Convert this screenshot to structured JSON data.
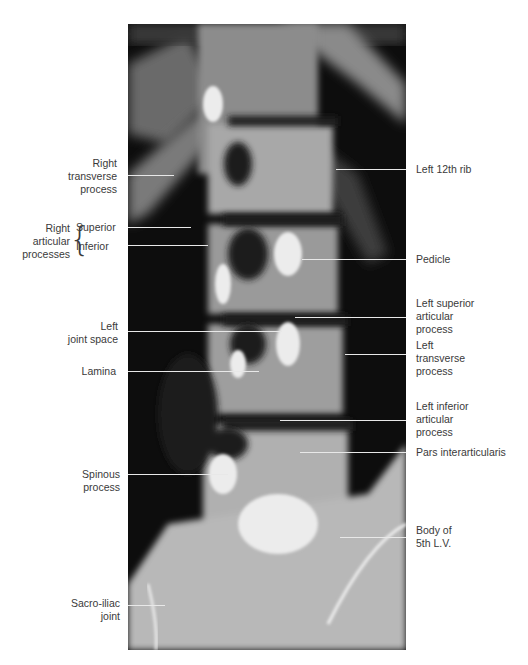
{
  "figure": {
    "labels_left": [
      {
        "id": "right-transverse-process",
        "text": "Right\ntransverse\nprocess"
      },
      {
        "id": "right-articular-processes",
        "text": "Right\narticular\nprocesses"
      },
      {
        "id": "left-joint-space",
        "text": "Left\njoint space"
      },
      {
        "id": "lamina",
        "text": "Lamina"
      },
      {
        "id": "spinous-process",
        "text": "Spinous\nprocess"
      },
      {
        "id": "sacro-iliac-joint",
        "text": "Sacro-iliac\njoint"
      }
    ],
    "articular_sub": {
      "superior": "Superior",
      "inferior": "Inferior"
    },
    "labels_right": [
      {
        "id": "left-12th-rib",
        "text": "Left 12th rib"
      },
      {
        "id": "pedicle",
        "text": "Pedicle"
      },
      {
        "id": "left-superior-articular-process",
        "text": "Left superior\narticular\nprocess"
      },
      {
        "id": "left-transverse-process",
        "text": "Left\ntransverse\nprocess"
      },
      {
        "id": "left-inferior-articular-process",
        "text": "Left inferior\narticular\nprocess"
      },
      {
        "id": "pars-interarticularis",
        "text": "Pars interarticularis"
      },
      {
        "id": "body-of-5th-lv",
        "text": "Body of\n5th L.V."
      }
    ]
  },
  "colors": {
    "background": "#ffffff",
    "xray_dark": "#0c0c0c",
    "bone_light": "#e6e6e6",
    "text": "#3a3a3a",
    "leader_line": "#e8e8e8"
  }
}
